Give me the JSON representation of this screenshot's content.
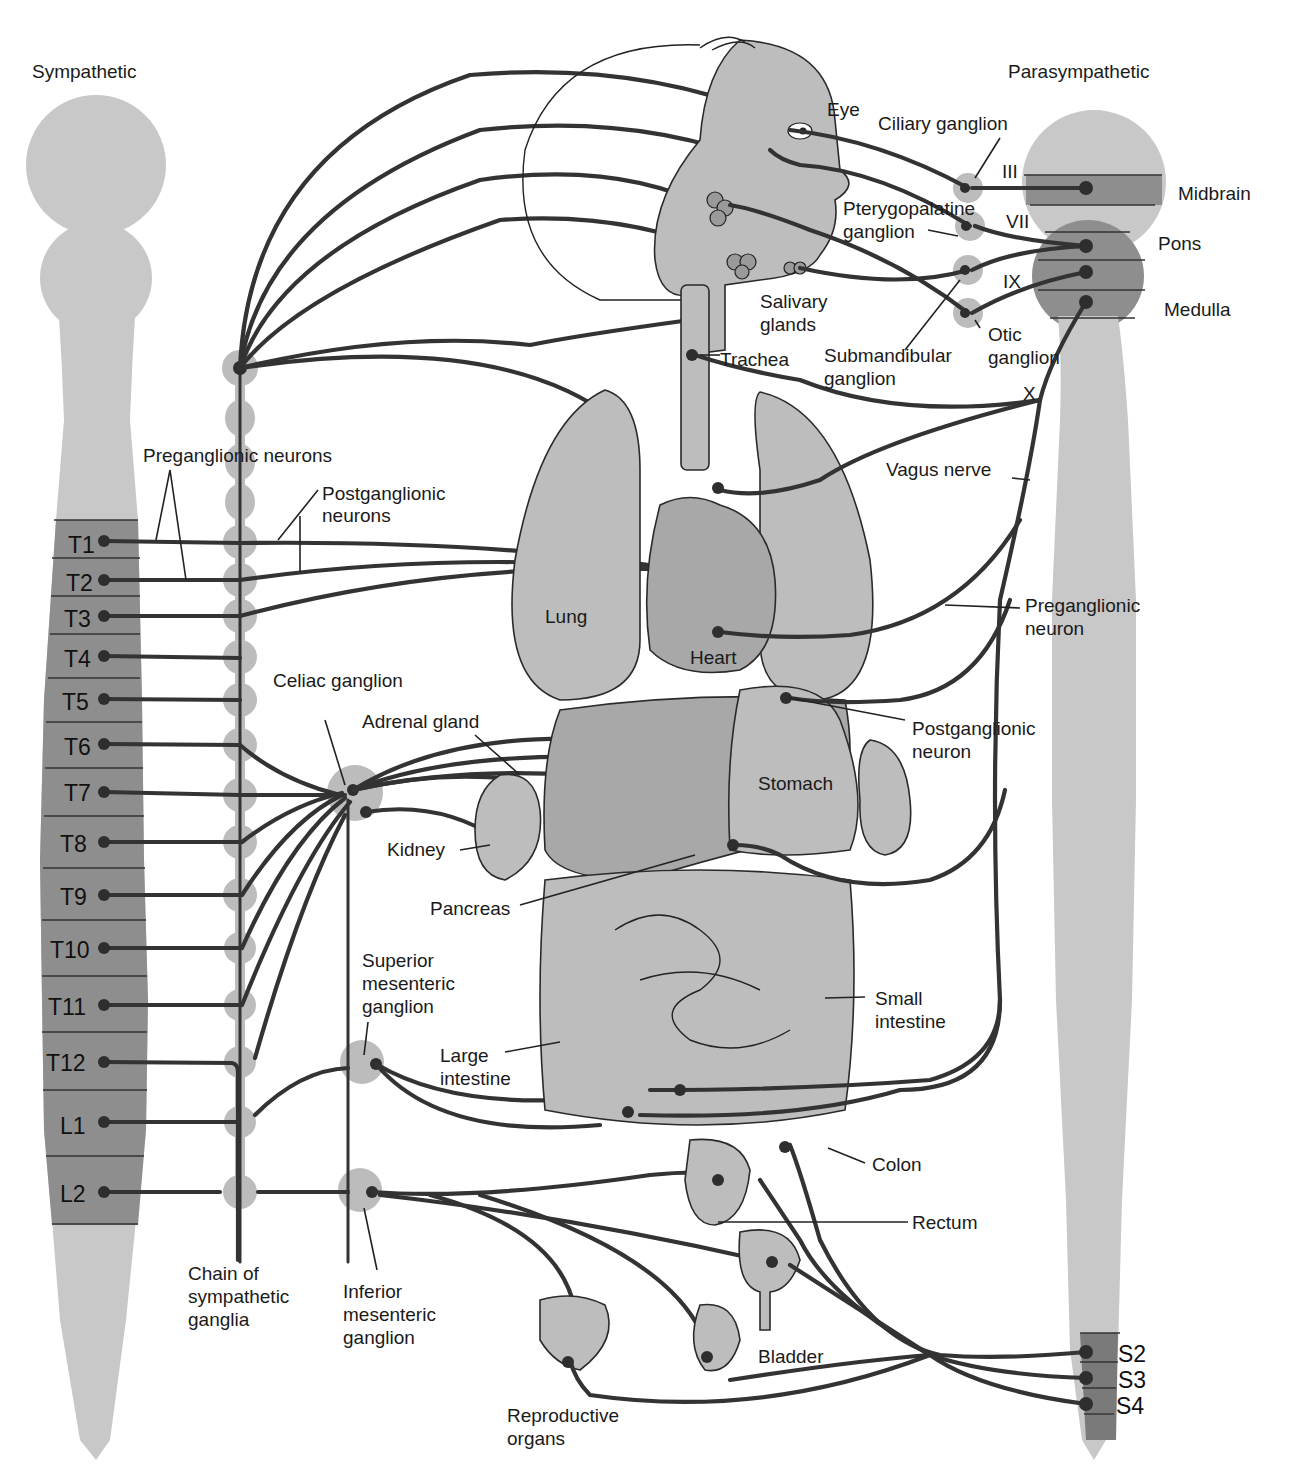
{
  "titles": {
    "sympathetic": "Sympathetic",
    "parasympathetic": "Parasympathetic"
  },
  "colors": {
    "cord_light": "#c8c8c8",
    "cord_dark": "#8a8a8a",
    "ganglion": "#bcbcbc",
    "nerve": "#333333",
    "organ": "#bdbdbd"
  },
  "spinal_segments": {
    "thoracic": [
      "T1",
      "T2",
      "T3",
      "T4",
      "T5",
      "T6",
      "T7",
      "T8",
      "T9",
      "T10",
      "T11",
      "T12"
    ],
    "lumbar": [
      "L1",
      "L2"
    ],
    "sacral": [
      "S2",
      "S3",
      "S4"
    ]
  },
  "brainstem": {
    "midbrain": "Midbrain",
    "pons": "Pons",
    "medulla": "Medulla",
    "cranial_nerves": [
      "III",
      "VII",
      "IX",
      "X"
    ]
  },
  "labels": {
    "eye": "Eye",
    "ciliary_ganglion": "Ciliary ganglion",
    "pterygopalatine_ganglion_1": "Pterygopalatine",
    "pterygopalatine_ganglion_2": "ganglion",
    "salivary_glands_1": "Salivary",
    "salivary_glands_2": "glands",
    "submandibular_ganglion_1": "Submandibular",
    "submandibular_ganglion_2": "ganglion",
    "otic_ganglion_1": "Otic",
    "otic_ganglion_2": "ganglion",
    "trachea": "Trachea",
    "vagus_nerve": "Vagus nerve",
    "preganglionic_neurons": "Preganglionic neurons",
    "postganglionic_neurons_1": "Postganglionic",
    "postganglionic_neurons_2": "neurons",
    "lung": "Lung",
    "heart": "Heart",
    "preganglionic_neuron_1": "Preganglionic",
    "preganglionic_neuron_2": "neuron",
    "celiac_ganglion": "Celiac ganglion",
    "adrenal_gland": "Adrenal gland",
    "postganglionic_neuron_1": "Postganglionic",
    "postganglionic_neuron_2": "neuron",
    "stomach": "Stomach",
    "kidney": "Kidney",
    "pancreas": "Pancreas",
    "superior_mesenteric_1": "Superior",
    "superior_mesenteric_2": "mesenteric",
    "superior_mesenteric_3": "ganglion",
    "small_intestine_1": "Small",
    "small_intestine_2": "intestine",
    "large_intestine_1": "Large",
    "large_intestine_2": "intestine",
    "colon": "Colon",
    "rectum": "Rectum",
    "bladder": "Bladder",
    "chain_1": "Chain of",
    "chain_2": "sympathetic",
    "chain_3": "ganglia",
    "inferior_mesenteric_1": "Inferior",
    "inferior_mesenteric_2": "mesenteric",
    "inferior_mesenteric_3": "ganglion",
    "reproductive_1": "Reproductive",
    "reproductive_2": "organs"
  }
}
